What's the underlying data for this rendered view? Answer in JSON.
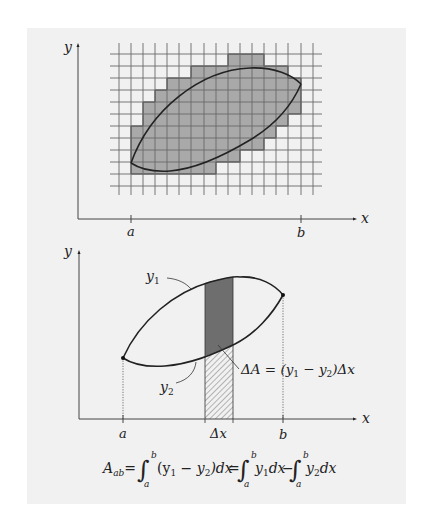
{
  "top_figure": {
    "axis_x_label": "x",
    "axis_y_label": "y",
    "tick_a": "a",
    "tick_b": "b",
    "description": "Region between two curves approximated by grid squares"
  },
  "bottom_figure": {
    "axis_x_label": "x",
    "axis_y_label": "y",
    "tick_a": "a",
    "tick_b": "b",
    "tick_dx": "Δx",
    "curve_upper_label": "y",
    "curve_upper_sub": "1",
    "curve_lower_label": "y",
    "curve_lower_sub": "2",
    "strip_annotation": {
      "lhs": "ΔA = (y",
      "sub1": "1",
      "mid": " − y",
      "sub2": "2",
      "rhs": ")Δx"
    }
  },
  "formula": {
    "lhs": "A",
    "lhs_sub": "ab",
    "eq": "=",
    "int_lower": "a",
    "int_upper": "b",
    "term1": "(y",
    "term1_sub1": "1",
    "term1_mid": " − y",
    "term1_sub2": "2",
    "term1_end": ")dx",
    "term2": "y",
    "term2_sub": "1",
    "term2_end": "dx",
    "minus": "−",
    "term3": "y",
    "term3_sub": "2",
    "term3_end": "dx"
  },
  "colors": {
    "panel_bg": "#f1f1f1",
    "grid_line": "#6a6a6a",
    "shaded_fill": "#a9a9a9",
    "strip_dark": "#6e6e6e",
    "curve": "#222222"
  }
}
